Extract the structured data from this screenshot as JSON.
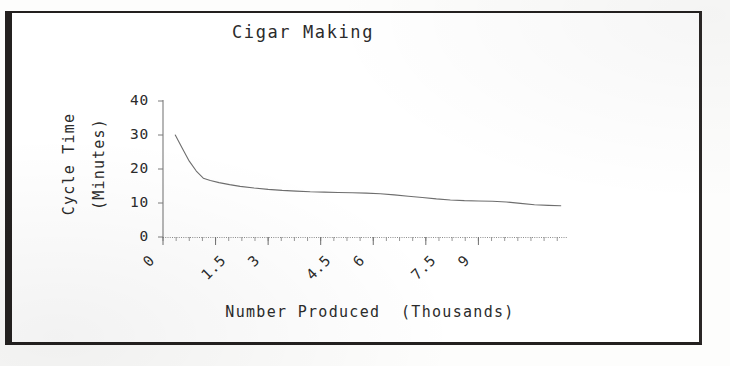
{
  "document": {
    "kind": "scanned-figure",
    "border_color": "#23201f",
    "background_color": "#ffffff"
  },
  "chart_data": {
    "type": "line",
    "title": "Cigar Making",
    "xlabel": "Number Produced  (Thousands)",
    "ylabel_line1": "Cycle Time",
    "ylabel_line2": "(Minutes)",
    "grid": false,
    "legend": "none",
    "xlim": [
      0,
      11.5
    ],
    "ylim": [
      0,
      40
    ],
    "xticks": [
      0,
      1.5,
      3,
      4.5,
      6,
      7.5,
      9
    ],
    "xtick_labels": [
      "0",
      "1.5",
      "3",
      "4.5",
      "6",
      "7.5",
      "9"
    ],
    "xtick_rotation": -45,
    "xminor_tick_step": 0.375,
    "yticks": [
      0,
      10,
      20,
      30,
      40
    ],
    "ytick_labels": [
      "0",
      "10",
      "20",
      "30",
      "40"
    ],
    "series": [
      {
        "name": "Cycle Time",
        "line_color": "#6e6e6e",
        "x": [
          0.35,
          0.55,
          0.75,
          0.95,
          1.15,
          1.35,
          1.6,
          1.9,
          2.2,
          2.6,
          3.0,
          3.4,
          3.8,
          4.2,
          4.6,
          5.0,
          5.4,
          5.8,
          6.2,
          6.6,
          7.0,
          7.4,
          7.8,
          8.2,
          8.6,
          9.0,
          9.4,
          9.8,
          10.2,
          10.6,
          11.0,
          11.35
        ],
        "y": [
          30.0,
          26.1,
          22.3,
          19.4,
          17.3,
          16.6,
          16.0,
          15.4,
          14.9,
          14.4,
          14.0,
          13.7,
          13.5,
          13.3,
          13.2,
          13.1,
          13.0,
          12.9,
          12.7,
          12.4,
          12.0,
          11.6,
          11.2,
          10.9,
          10.7,
          10.6,
          10.5,
          10.3,
          9.9,
          9.5,
          9.3,
          9.2
        ]
      }
    ]
  },
  "geometry": {
    "plot_left": 163,
    "plot_right": 566,
    "plot_top": 101,
    "plot_bottom": 237
  }
}
